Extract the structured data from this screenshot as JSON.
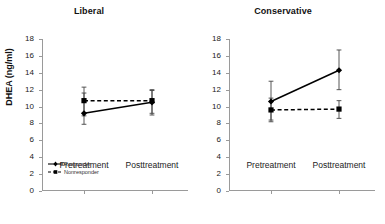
{
  "figure": {
    "ylabel": "DHEA (ng/ml)",
    "ytick_labels": [
      "18",
      "16",
      "14",
      "12",
      "10",
      "8",
      "6",
      "4",
      "2",
      "0"
    ],
    "xtick_labels": [
      "Pretreatment",
      "Posttreatment"
    ],
    "legend": [
      {
        "label": "Responder",
        "style": "solid",
        "marker": "diamond"
      },
      {
        "label": "Nonresponder",
        "style": "dashed",
        "marker": "square"
      }
    ],
    "colors": {
      "line": "#000000",
      "axis": "#9a9a9a",
      "text": "#1a1a1a"
    }
  },
  "chart_data": [
    {
      "type": "line",
      "title": "Liberal",
      "xlabel": "",
      "ylabel": "DHEA (ng/ml)",
      "categories": [
        "Pretreatment",
        "Posttreatment"
      ],
      "ylim": [
        0,
        18
      ],
      "yticks": [
        0,
        2,
        4,
        6,
        8,
        10,
        12,
        14,
        16,
        18
      ],
      "grid": false,
      "legend_position": "lower-left",
      "series": [
        {
          "name": "Responder",
          "style": "solid",
          "marker": "diamond",
          "values": [
            9.2,
            10.5
          ],
          "error_low": [
            7.9,
            9.0
          ],
          "error_high": [
            11.6,
            11.9
          ]
        },
        {
          "name": "Nonresponder",
          "style": "dashed",
          "marker": "square",
          "values": [
            10.7,
            10.7
          ],
          "error_low": [
            8.9,
            9.2
          ],
          "error_high": [
            12.3,
            12.0
          ]
        }
      ]
    },
    {
      "type": "line",
      "title": "Conservative",
      "xlabel": "",
      "ylabel": "",
      "categories": [
        "Pretreatment",
        "Posttreatment"
      ],
      "ylim": [
        0,
        18
      ],
      "yticks": [
        0,
        2,
        4,
        6,
        8,
        10,
        12,
        14,
        16,
        18
      ],
      "grid": false,
      "legend_position": "none",
      "series": [
        {
          "name": "Responder",
          "style": "solid",
          "marker": "diamond",
          "values": [
            10.6,
            14.3
          ],
          "error_low": [
            8.4,
            12.0
          ],
          "error_high": [
            13.0,
            16.7
          ]
        },
        {
          "name": "Nonresponder",
          "style": "dashed",
          "marker": "square",
          "values": [
            9.6,
            9.7
          ],
          "error_low": [
            8.2,
            8.6
          ],
          "error_high": [
            11.0,
            10.7
          ]
        }
      ]
    }
  ]
}
